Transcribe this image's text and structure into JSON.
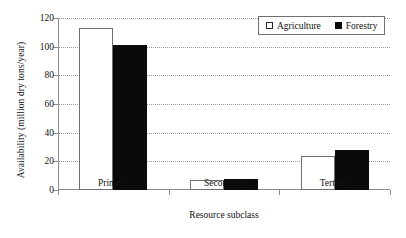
{
  "chart_data": {
    "type": "bar",
    "title": "",
    "xlabel": "Resource subclass",
    "ylabel": "Availability (million dry tons/year)",
    "categories": [
      "Primary",
      "Secondary",
      "Tertiary"
    ],
    "series": [
      {
        "name": "Agriculture",
        "values": [
          113,
          7,
          24
        ],
        "color": "#ffffff",
        "edge": "#6f6f6f"
      },
      {
        "name": "Forestry",
        "values": [
          101,
          8,
          28
        ],
        "color": "#0a0a0a",
        "edge": "#0a0a0a"
      }
    ],
    "ylim": [
      0,
      120
    ],
    "yticks": [
      0,
      20,
      40,
      60,
      80,
      100,
      120
    ],
    "ytick_labels": [
      "0",
      "20",
      "40",
      "60",
      "80",
      "100",
      "120"
    ],
    "grid": "horizontal-dotted",
    "legend_position": "top-right",
    "legend_entries": [
      {
        "label": "Agriculture",
        "marker": "hollow-square"
      },
      {
        "label": "Forestry",
        "marker": "filled-square"
      }
    ]
  }
}
